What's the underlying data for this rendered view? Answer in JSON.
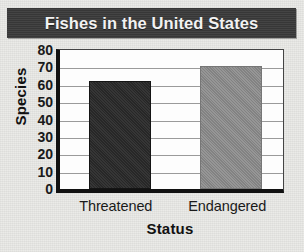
{
  "chart_data": {
    "type": "bar",
    "title": "Fishes in the United States",
    "categories": [
      "Threatened",
      "Endangered"
    ],
    "values": [
      62,
      71
    ],
    "xlabel": "Status",
    "ylabel": "Species",
    "ylim": [
      0,
      80
    ],
    "ytick_values": [
      0,
      10,
      20,
      30,
      40,
      50,
      60,
      70,
      80
    ],
    "ytick_labels": [
      "0",
      "10",
      "20",
      "30",
      "40",
      "50",
      "60",
      "70",
      "80"
    ],
    "grid": true,
    "legend": null,
    "series": [
      {
        "name": "Species",
        "values": [
          62,
          71
        ]
      }
    ],
    "bar_colors": [
      "#2b2b2b",
      "#8c8c8c"
    ],
    "title_background": "#3a3a3a",
    "title_color": "#f2f2f2",
    "plot_background": "#fdfdfd",
    "page_background": "#e9e9e6",
    "axis_color": "#111111",
    "grid_color": "#9a9a9a"
  }
}
